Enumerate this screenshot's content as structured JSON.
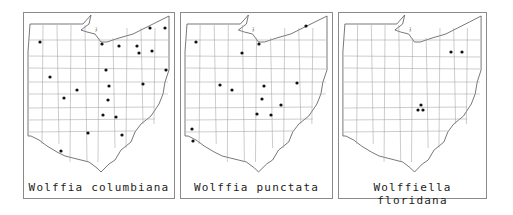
{
  "figure": {
    "panels": [
      {
        "id": "columbiana",
        "title": "Wolffia columbiana",
        "frame": {
          "x": 23,
          "y": 12,
          "w": 152,
          "h": 187
        },
        "caption_top": 181,
        "records": [
          [
            40,
            42
          ],
          [
            102,
            44
          ],
          [
            119,
            46
          ],
          [
            137,
            46
          ],
          [
            150,
            28
          ],
          [
            165,
            28
          ],
          [
            139,
            53
          ],
          [
            152,
            51
          ],
          [
            166,
            70
          ],
          [
            50,
            77
          ],
          [
            106,
            70
          ],
          [
            77,
            90
          ],
          [
            109,
            86
          ],
          [
            143,
            84
          ],
          [
            64,
            98
          ],
          [
            108,
            100
          ],
          [
            103,
            115
          ],
          [
            116,
            117
          ],
          [
            88,
            133
          ],
          [
            122,
            135
          ],
          [
            61,
            151
          ]
        ]
      },
      {
        "id": "punctata",
        "title": "Wolffia punctata",
        "frame": {
          "x": 180,
          "y": 12,
          "w": 153,
          "h": 187
        },
        "caption_top": 181,
        "records": [
          [
            196,
            42
          ],
          [
            259,
            44
          ],
          [
            306,
            26
          ],
          [
            242,
            53
          ],
          [
            220,
            85
          ],
          [
            232,
            90
          ],
          [
            264,
            86
          ],
          [
            297,
            83
          ],
          [
            262,
            99
          ],
          [
            281,
            105
          ],
          [
            257,
            114
          ],
          [
            271,
            115
          ],
          [
            192,
            129
          ],
          [
            193,
            141
          ]
        ]
      },
      {
        "id": "floridana",
        "title": "Wolffiella floridana",
        "frame": {
          "x": 338,
          "y": 12,
          "w": 149,
          "h": 187
        },
        "caption_top": 181,
        "records": [
          [
            451,
            52
          ],
          [
            462,
            52
          ],
          [
            421,
            105
          ],
          [
            418,
            110
          ],
          [
            423,
            110
          ]
        ]
      }
    ],
    "colors": {
      "border": "#8a8a8a",
      "county_line": "#9a9a9a",
      "outline": "#555555",
      "dot": "#111111"
    }
  }
}
